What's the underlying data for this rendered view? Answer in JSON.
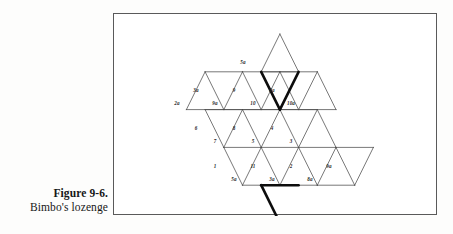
{
  "caption": {
    "figure_number": "Figure 9-6.",
    "title": "Bimbo's lozenge"
  },
  "figure": {
    "name": "bimbos-lozenge",
    "frame": {
      "x": 113,
      "y": 13,
      "width": 324,
      "height": 202,
      "border_color": "#5a5a5a"
    },
    "grid": {
      "origin_x": 35,
      "origin_y": 20,
      "half_width": 18.7,
      "row_height": 37.8,
      "rows": 5,
      "line_color": "#4b4b4b",
      "bold_line_color": "#0d0d0d"
    },
    "cells": [
      {
        "id": "c-5a",
        "label": "5a",
        "row": 1,
        "col": 7,
        "orient": "up",
        "label_x": 242,
        "label_y": 62
      },
      {
        "id": "c-3a",
        "label": "3a",
        "row": 2,
        "col": 4,
        "orient": "down",
        "label_x": 195,
        "label_y": 90
      },
      {
        "id": "c-2a",
        "label": "2a",
        "row": 2,
        "col": 3,
        "orient": "up",
        "label_x": 176,
        "label_y": 103
      },
      {
        "id": "c-9a",
        "label": "9a",
        "row": 2,
        "col": 5,
        "orient": "up",
        "label_x": 214,
        "label_y": 103
      },
      {
        "id": "c-9",
        "label": "9",
        "row": 2,
        "col": 6,
        "orient": "down",
        "label_x": 233,
        "label_y": 90
      },
      {
        "id": "c-10",
        "label": "10",
        "row": 2,
        "col": 7,
        "orient": "up",
        "label_x": 252,
        "label_y": 103
      },
      {
        "id": "c-6a",
        "label": "6a",
        "row": 2,
        "col": 8,
        "orient": "down",
        "label_x": 271,
        "label_y": 90
      },
      {
        "id": "c-10a",
        "label": "10a",
        "row": 2,
        "col": 9,
        "orient": "up",
        "label_x": 290,
        "label_y": 103
      },
      {
        "id": "c-6",
        "label": "6",
        "row": 3,
        "col": 4,
        "orient": "down",
        "label_x": 195,
        "label_y": 128
      },
      {
        "id": "c-7",
        "label": "7",
        "row": 3,
        "col": 5,
        "orient": "up",
        "label_x": 214,
        "label_y": 141
      },
      {
        "id": "c-8",
        "label": "8",
        "row": 3,
        "col": 6,
        "orient": "down",
        "label_x": 233,
        "label_y": 128
      },
      {
        "id": "c-5",
        "label": "5",
        "row": 3,
        "col": 7,
        "orient": "up",
        "label_x": 252,
        "label_y": 141
      },
      {
        "id": "c-4",
        "label": "4",
        "row": 3,
        "col": 8,
        "orient": "down",
        "label_x": 271,
        "label_y": 128
      },
      {
        "id": "c-3",
        "label": "3",
        "row": 3,
        "col": 9,
        "orient": "up",
        "label_x": 290,
        "label_y": 141
      },
      {
        "id": "c-1",
        "label": "1",
        "row": 4,
        "col": 5,
        "orient": "down",
        "label_x": 214,
        "label_y": 166
      },
      {
        "id": "c-5b",
        "label": "5a",
        "row": 4,
        "col": 6,
        "orient": "up",
        "label_x": 233,
        "label_y": 179
      },
      {
        "id": "c-11",
        "label": "11",
        "row": 4,
        "col": 7,
        "orient": "down",
        "label_x": 252,
        "label_y": 166
      },
      {
        "id": "c-3b",
        "label": "3a",
        "row": 4,
        "col": 8,
        "orient": "up",
        "label_x": 271,
        "label_y": 179
      },
      {
        "id": "c-2",
        "label": "2",
        "row": 4,
        "col": 9,
        "orient": "down",
        "label_x": 290,
        "label_y": 166
      },
      {
        "id": "c-8a",
        "label": "8a",
        "row": 4,
        "col": 10,
        "orient": "up",
        "label_x": 309,
        "label_y": 179
      },
      {
        "id": "c-9b",
        "label": "9a",
        "row": 4,
        "col": 11,
        "orient": "down",
        "label_x": 328,
        "label_y": 166
      }
    ]
  }
}
